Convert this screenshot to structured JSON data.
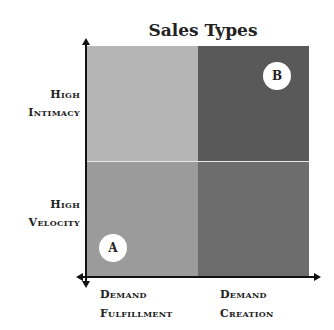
{
  "title": "Sales Types",
  "colors": {
    "top_left": "#b4b4b4",
    "top_right": "#5a5a5a",
    "bottom_left": "#9a9a9a",
    "bottom_right": "#6e6e6e",
    "axis": "#111111"
  },
  "y_axis": {
    "top_label": [
      "High",
      "Intimacy"
    ],
    "bottom_label": [
      "High",
      "Velocity"
    ]
  },
  "x_axis": {
    "left_label": [
      "Demand",
      "Fulfillment"
    ],
    "right_label": [
      "Demand",
      "Creation"
    ]
  },
  "markers": [
    {
      "label": "A",
      "quadrant": "bottom-left"
    },
    {
      "label": "B",
      "quadrant": "top-right"
    }
  ]
}
